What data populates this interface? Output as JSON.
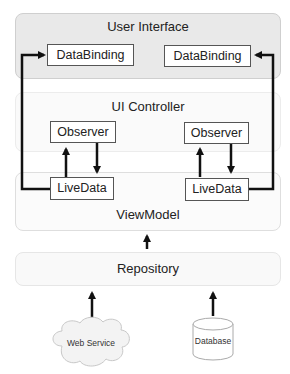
{
  "diagram": {
    "layers": {
      "user_interface": "User Interface",
      "ui_controller": "UI Controller",
      "view_model": "ViewModel",
      "repository": "Repository"
    },
    "boxes": {
      "databinding_left": "DataBinding",
      "databinding_right": "DataBinding",
      "observer_left": "Observer",
      "observer_right": "Observer",
      "livedata_left": "LiveData",
      "livedata_right": "LiveData"
    },
    "sources": {
      "web_service": "Web Service",
      "database": "Database"
    },
    "colors": {
      "ui_layer_fill": "#e9e9e9",
      "arrow": "#111111",
      "box_border": "#555555"
    }
  }
}
